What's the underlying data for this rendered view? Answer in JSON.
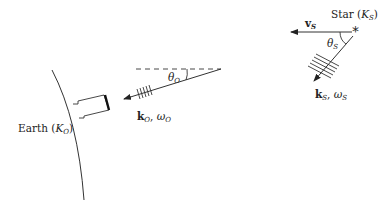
{
  "star": {
    "label": "Star",
    "frame_open": " (",
    "frame_symbol": "K",
    "frame_sub": "S",
    "frame_close": ")",
    "marker_glyph": "*",
    "velocity": {
      "symbol": "v",
      "sub": "S"
    },
    "angle": {
      "symbol": "θ",
      "sub": "S"
    },
    "wave": {
      "k_symbol": "k",
      "k_sub": "S",
      "sep": ", ",
      "omega_symbol": "ω",
      "omega_sub": "S"
    }
  },
  "observer": {
    "angle": {
      "symbol": "θ",
      "sub": "O"
    },
    "wave": {
      "k_symbol": "k",
      "k_sub": "O",
      "sep": ", ",
      "omega_symbol": "ω",
      "omega_sub": "O"
    }
  },
  "earth": {
    "label": "Earth",
    "frame_open": " (",
    "frame_symbol": "K",
    "frame_sub": "O",
    "frame_close": ")"
  },
  "colors": {
    "line": "#333333",
    "background": "#ffffff"
  }
}
